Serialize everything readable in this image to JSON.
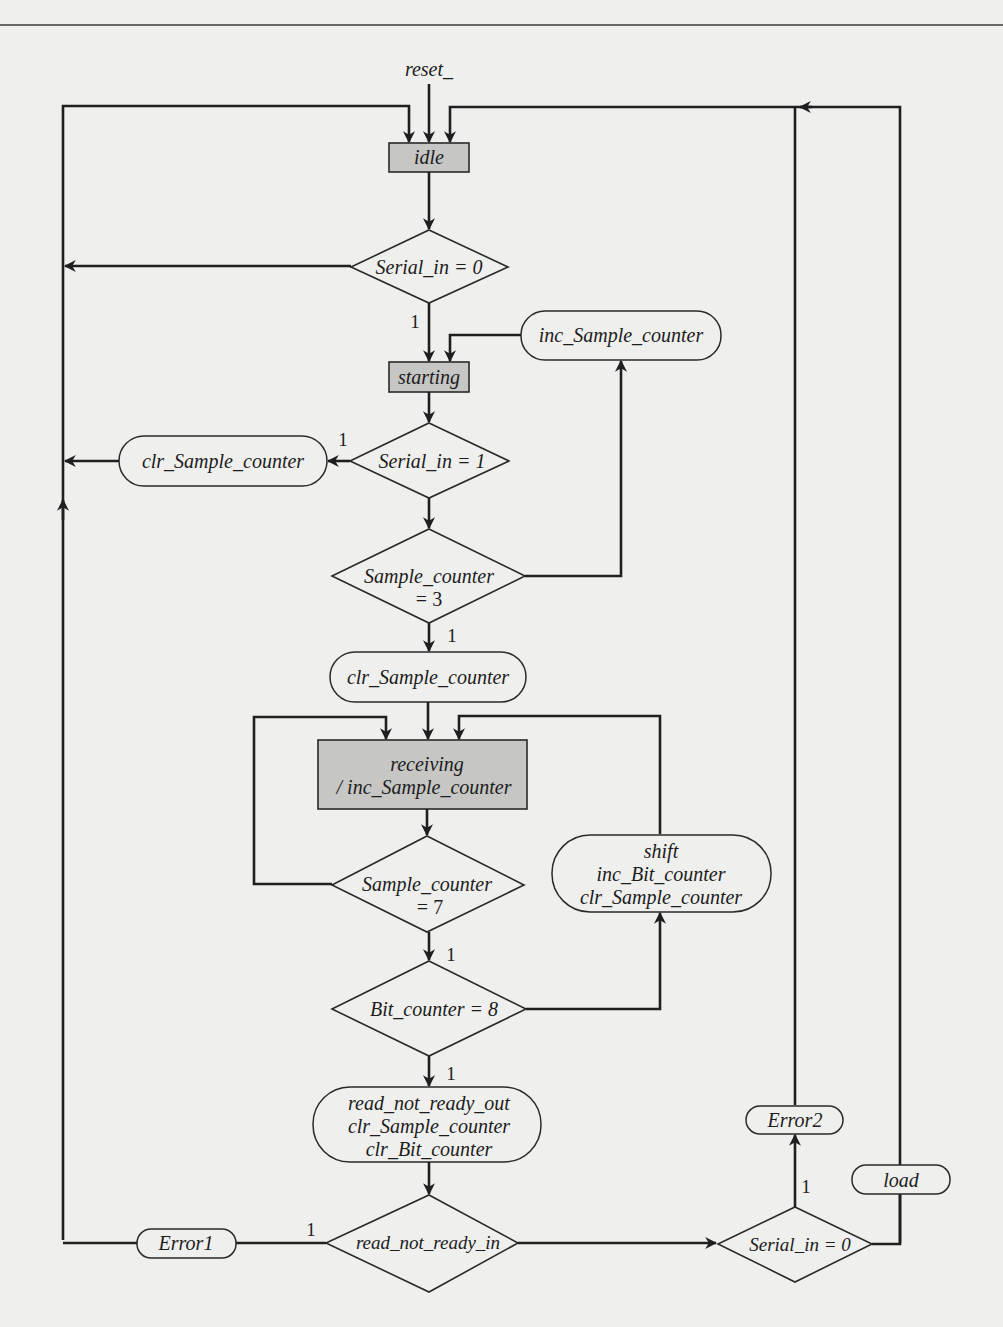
{
  "diagram": {
    "type": "ASMD flowchart (UART receiver)",
    "reset_signal": "reset_",
    "states": {
      "idle": "idle",
      "starting": "starting",
      "receiving_line1": "receiving",
      "receiving_line2": "/ inc_Sample_counter"
    },
    "decisions": {
      "d_serial_in_0_top": "Serial_in = 0",
      "d_serial_in_1": "Serial_in = 1",
      "d_sample_counter_3_line1": "Sample_counter",
      "d_sample_counter_3_line2": "= 3",
      "d_sample_counter_7_line1": "Sample_counter",
      "d_sample_counter_7_line2": "= 7",
      "d_bit_counter_8": "Bit_counter = 8",
      "d_read_not_ready_in": "read_not_ready_in",
      "d_serial_in_0_bottom": "Serial_in = 0"
    },
    "conditional_outputs": {
      "inc_sample_counter": "inc_Sample_counter",
      "clr_sample_counter_left": "clr_Sample_counter",
      "clr_sample_counter_mid": "clr_Sample_counter",
      "shift_line1": "shift",
      "shift_line2": "inc_Bit_counter",
      "shift_line3": "clr_Sample_counter",
      "rnr_line1": "read_not_ready_out",
      "rnr_line2": "clr_Sample_counter",
      "rnr_line3": "clr_Bit_counter",
      "error1": "Error1",
      "error2": "Error2",
      "load": "load"
    },
    "branch_labels": {
      "serial_in_0_top_true": "1",
      "serial_in_1_true": "1",
      "sample_counter_3_true": "1",
      "sample_counter_7_true": "1",
      "bit_counter_8_true": "1",
      "read_not_ready_in_true": "1",
      "serial_in_0_bottom_true": "1"
    }
  }
}
